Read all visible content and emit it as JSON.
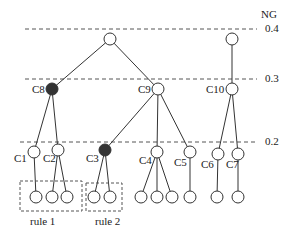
{
  "axis": {
    "title": "NG",
    "levels": [
      {
        "label": "0.4",
        "y": 29
      },
      {
        "label": "0.3",
        "y": 79
      },
      {
        "label": "0.2",
        "y": 142
      }
    ]
  },
  "nodes": {
    "rootA": {
      "label": "",
      "x": 110,
      "y": 39,
      "filled": false
    },
    "rootB": {
      "label": "",
      "x": 232,
      "y": 39,
      "filled": false
    },
    "C8": {
      "label": "C8",
      "x": 52,
      "y": 89,
      "filled": true
    },
    "C9": {
      "label": "C9",
      "x": 158,
      "y": 89,
      "filled": false
    },
    "C10": {
      "label": "C10",
      "x": 232,
      "y": 89,
      "filled": false
    },
    "C1": {
      "label": "C1",
      "x": 34,
      "y": 152,
      "filled": false
    },
    "C2": {
      "label": "C2",
      "x": 58,
      "y": 150,
      "filled": false
    },
    "C3": {
      "label": "C3",
      "x": 105,
      "y": 150,
      "filled": true
    },
    "C4": {
      "label": "C4",
      "x": 157,
      "y": 152,
      "filled": false
    },
    "C5": {
      "label": "C5",
      "x": 190,
      "y": 152,
      "filled": false
    },
    "C6": {
      "label": "C6",
      "x": 218,
      "y": 154,
      "filled": false
    },
    "C7": {
      "label": "C7",
      "x": 238,
      "y": 154,
      "filled": false
    }
  },
  "groups": [
    {
      "label": "rule 1"
    },
    {
      "label": "rule 2"
    }
  ],
  "colors": {
    "line": "#333333",
    "filled": "#333333",
    "dash": "#555555"
  }
}
